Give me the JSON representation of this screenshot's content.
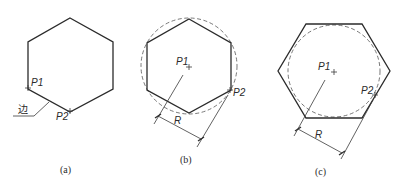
{
  "figures": [
    {
      "id": "a",
      "caption": "(a)",
      "description": "Hexagon defined by edge endpoints",
      "points": {
        "p1": "P1",
        "p2": "P2"
      },
      "leader_label": "边"
    },
    {
      "id": "b",
      "caption": "(b)",
      "description": "Hexagon inscribed in circle of radius R",
      "points": {
        "p1": "P1",
        "p2": "P2"
      },
      "dimension_label": "R"
    },
    {
      "id": "c",
      "caption": "(c)",
      "description": "Hexagon circumscribed about circle of radius R",
      "points": {
        "p1": "P1",
        "p2": "P2"
      },
      "dimension_label": "R"
    }
  ],
  "colors": {
    "line": "#2b2b2b",
    "background": "#ffffff"
  }
}
